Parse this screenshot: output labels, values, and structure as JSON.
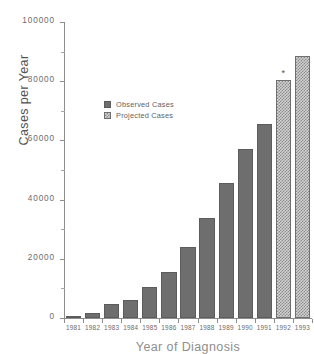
{
  "chart_data": {
    "type": "bar",
    "title": "",
    "xlabel": "Year of Diagnosis",
    "ylabel": "Cases per Year",
    "categories": [
      "1981",
      "1982",
      "1983",
      "1984",
      "1985",
      "1986",
      "1987",
      "1988",
      "1989",
      "1990",
      "1991",
      "1992",
      "1993"
    ],
    "series": [
      {
        "name": "Observed Cases",
        "kind": "observed",
        "color": "#6e6e6e",
        "values": [
          300,
          1700,
          4700,
          6000,
          10500,
          15500,
          24000,
          33800,
          45500,
          57000,
          65500,
          null,
          null
        ]
      },
      {
        "name": "Projected Cases",
        "kind": "projected",
        "color": "#d2d2d2",
        "values": [
          null,
          null,
          null,
          null,
          null,
          null,
          null,
          null,
          null,
          null,
          null,
          80500,
          88500
        ]
      }
    ],
    "ylim": [
      0,
      100000
    ],
    "ytick_major": [
      0,
      20000,
      40000,
      60000,
      80000,
      100000
    ],
    "ytick_major_labels": [
      "0",
      "20000",
      "40000",
      "60000",
      "80000",
      "100000"
    ],
    "ytick_minor": [
      10000,
      30000,
      50000,
      70000,
      90000
    ],
    "grid": false,
    "legend_position": "upper-left-inset",
    "annotations": [
      {
        "text": "*",
        "category": "1992",
        "note": "asterisk marker above 1992 projected bar"
      }
    ]
  },
  "legend": {
    "items": [
      {
        "label": "Observed Cases",
        "swatch": "solid-gray-square-icon"
      },
      {
        "label": "Projected Cases",
        "swatch": "hatched-gray-square-icon"
      }
    ]
  }
}
